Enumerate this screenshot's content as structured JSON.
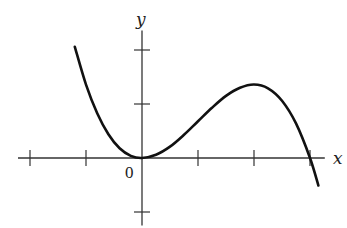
{
  "chart_data": {
    "type": "line",
    "title": "",
    "xlabel": "x",
    "ylabel": "y",
    "origin_label": "0",
    "grid": false,
    "legend": null,
    "x_ticks": [
      -2,
      -1,
      0,
      1,
      2,
      3
    ],
    "y_ticks": [
      -1,
      1,
      2
    ],
    "xlim": [
      -2.25,
      3.3
    ],
    "ylim": [
      -1.25,
      2.4
    ],
    "function_description": "cubic with double root at x=0 (local minimum on axis), local maximum near x=2, crossing x-axis at x=3",
    "series": [
      {
        "name": "curve",
        "x": [
          -1.2,
          -1.0,
          -0.8,
          -0.6,
          -0.4,
          -0.2,
          0.0,
          0.25,
          0.5,
          0.75,
          1.0,
          1.25,
          1.5,
          1.75,
          2.0,
          2.25,
          2.5,
          2.75,
          3.0,
          3.15
        ],
        "y": [
          2.06,
          1.36,
          0.83,
          0.44,
          0.18,
          0.04,
          0.0,
          0.06,
          0.21,
          0.43,
          0.68,
          0.93,
          1.15,
          1.3,
          1.36,
          1.29,
          1.06,
          0.64,
          0.0,
          -0.51
        ]
      }
    ],
    "key_points": {
      "local_min": [
        0,
        0
      ],
      "local_max": [
        2,
        1.36
      ],
      "x_intercepts": [
        0,
        3
      ],
      "left_endpoint": [
        -1.2,
        2.06
      ],
      "right_endpoint": [
        3.15,
        -0.51
      ]
    }
  },
  "style": {
    "line_color": "#111111",
    "axis_color": "#333333",
    "background": "#ffffff"
  },
  "layout": {
    "origin_px": [
      142,
      158
    ],
    "unit_x_px": 56,
    "unit_y_px": 54
  }
}
